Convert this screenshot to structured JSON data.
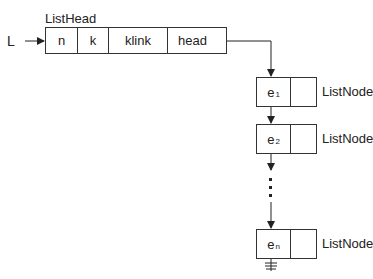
{
  "diagram": {
    "pointer_label": "L",
    "list_head": {
      "title": "ListHead",
      "fields": [
        "n",
        "k",
        "klink",
        "head"
      ]
    },
    "nodes": [
      {
        "elem": "e",
        "sub": "1",
        "type_label": "ListNode"
      },
      {
        "elem": "e",
        "sub": "2",
        "type_label": "ListNode"
      },
      {
        "elem": "e",
        "sub": "n",
        "type_label": "ListNode"
      }
    ],
    "ellipsis": "⋮",
    "terminator": "null-ground-symbol"
  }
}
